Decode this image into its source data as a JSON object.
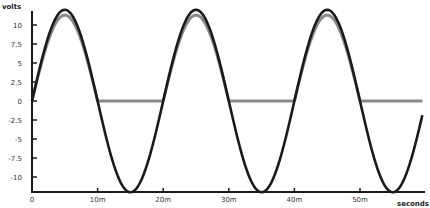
{
  "chart_data": {
    "type": "line",
    "title": "",
    "xlabel": "seconds",
    "ylabel": "volts",
    "xlim": [
      0,
      0.0595
    ],
    "ylim": [
      -12,
      12
    ],
    "grid": false,
    "legend": null,
    "x_ticks": [
      0,
      0.01,
      0.02,
      0.03,
      0.04,
      0.05
    ],
    "x_tick_labels": [
      "0",
      "10m",
      "20m",
      "30m",
      "40m",
      "50m"
    ],
    "y_ticks": [
      10,
      7.5,
      5,
      2.5,
      0,
      -2.5,
      -5,
      -7.5,
      -10
    ],
    "y_tick_labels": [
      "10",
      "7.5",
      "5",
      "2.5",
      "0",
      "-2.5",
      "-5",
      "-7.5",
      "-10"
    ],
    "series": [
      {
        "name": "input (sine)",
        "color": "#1a1a1a",
        "function": "12*sin(2*pi*50*t)",
        "amplitude": 12,
        "frequency_hz": 50,
        "x": [
          0,
          0.0025,
          0.005,
          0.0075,
          0.01,
          0.0125,
          0.015,
          0.0175,
          0.02,
          0.025,
          0.03,
          0.035,
          0.04,
          0.045,
          0.05,
          0.055
        ],
        "values": [
          0,
          8.49,
          12,
          8.49,
          0,
          -8.49,
          -12,
          -8.49,
          0,
          12,
          0,
          -12,
          0,
          12,
          0,
          -12
        ]
      },
      {
        "name": "output (half-wave rectified)",
        "color": "#8a8a8a",
        "function": "max(0, 11.3*sin(2*pi*50*t))",
        "amplitude": 11.3,
        "frequency_hz": 50,
        "x": [
          0,
          0.0025,
          0.005,
          0.0075,
          0.01,
          0.015,
          0.02,
          0.025,
          0.03,
          0.035,
          0.04,
          0.045,
          0.05,
          0.055
        ],
        "values": [
          0,
          7.99,
          11.3,
          7.99,
          0,
          0,
          0,
          11.3,
          0,
          0,
          0,
          11.3,
          0,
          0
        ]
      }
    ]
  }
}
